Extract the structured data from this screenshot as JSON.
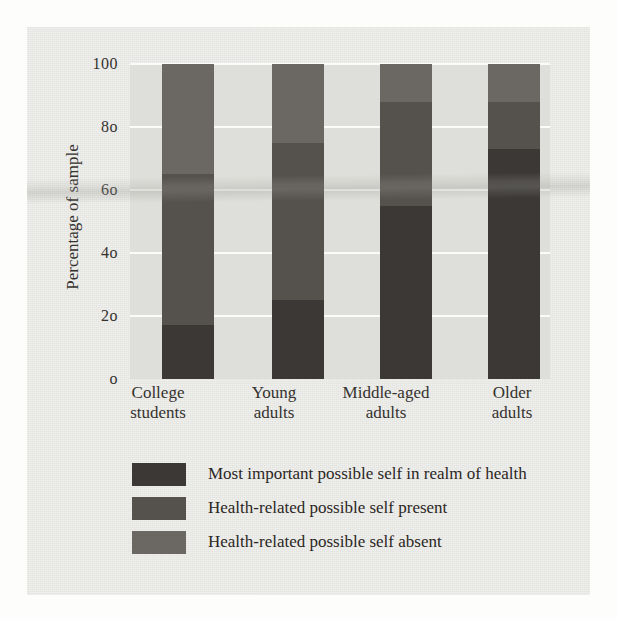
{
  "chart_data": {
    "type": "bar",
    "subtype": "stacked-bar-100",
    "title": "",
    "xlabel": "",
    "ylabel": "Percentage of sample",
    "ylim": [
      0,
      100
    ],
    "yticks": [
      0,
      20,
      40,
      60,
      80,
      100
    ],
    "ytick_labels": [
      "o",
      "2o",
      "4o",
      "6o",
      "8o",
      "100"
    ],
    "grid": true,
    "grid_color": "#fbfbfa",
    "legend_position": "below-plot",
    "categories": [
      "College students",
      "Young adults",
      "Middle-aged adults",
      "Older adults"
    ],
    "category_lines": [
      [
        "College",
        "students"
      ],
      [
        "Young",
        "adults"
      ],
      [
        "Middle-aged",
        "adults"
      ],
      [
        "Older",
        "adults"
      ]
    ],
    "series": [
      {
        "name": "Most important possible self in realm of health",
        "color": "#3b3835",
        "values": [
          17,
          25,
          55,
          73
        ]
      },
      {
        "name": "Health-related possible self present",
        "color": "#55514d",
        "values": [
          48,
          50,
          33,
          15
        ]
      },
      {
        "name": "Health-related possible self absent",
        "color": "#6b6762",
        "values": [
          35,
          25,
          12,
          12
        ]
      }
    ],
    "stack_order": "bottom-to-top",
    "bar_totals": [
      100,
      100,
      100,
      100
    ]
  },
  "legend": {
    "items": [
      {
        "label": "Most important possible self in realm of health",
        "color": "#3b3835"
      },
      {
        "label": "Health-related possible self present",
        "color": "#55514d"
      },
      {
        "label": "Health-related possible self absent",
        "color": "#6b6762"
      }
    ]
  },
  "axes": {
    "y_title": "Percentage of sample",
    "y_ticks": [
      "100",
      "8o",
      "6o",
      "4o",
      "2o",
      "o"
    ],
    "x_ticks": [
      {
        "line1": "College",
        "line2": "students"
      },
      {
        "line1": "Young",
        "line2": "adults"
      },
      {
        "line1": "Middle-aged",
        "line2": "adults"
      },
      {
        "line1": "Older",
        "line2": "adults"
      }
    ]
  },
  "palette": {
    "page_background": "#fdfdfc",
    "figure_background": "#e9e9e6",
    "plot_background": "#dededa",
    "gridline": "#fbfbfa",
    "text": "#35322e"
  }
}
